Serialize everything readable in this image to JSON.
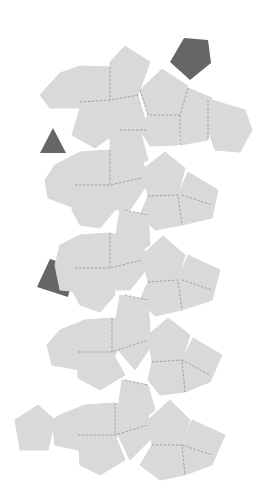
{
  "diagram": {
    "type": "polyhedron-net",
    "colors": {
      "background": "#ffffff",
      "face_fill": "#d9d9d9",
      "fold_line": "#8a8a8a",
      "separate_pieces": "#666666"
    },
    "separate_pieces": [
      {
        "shape": "pentagon",
        "position": "top-right"
      },
      {
        "shape": "triangle",
        "position": "left, upper"
      },
      {
        "shape": "square",
        "position": "left, middle"
      }
    ],
    "strips": 5
  }
}
